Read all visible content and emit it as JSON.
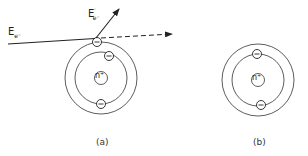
{
  "labels": {
    "incident_energy": "E",
    "incident_sub": "e⁻",
    "scattered_energy": "E",
    "scattered_sub": "e⁻",
    "scattered_prime": "′",
    "nucleus_a": "n⁺",
    "nucleus_b": "n⁺",
    "electron_symbol": "−",
    "caption_a": "(a)",
    "caption_b": "(b)"
  },
  "colors": {
    "stroke": "#222222",
    "background": "#ffffff"
  },
  "diagram": {
    "atom_a": {
      "cx": 101,
      "cy": 78,
      "outer_r": 36,
      "inner_r": 26,
      "nucleus_r": 6
    },
    "atom_b": {
      "cx": 258,
      "cy": 80,
      "outer_r": 36,
      "inner_r": 26,
      "nucleus_r": 6
    }
  }
}
